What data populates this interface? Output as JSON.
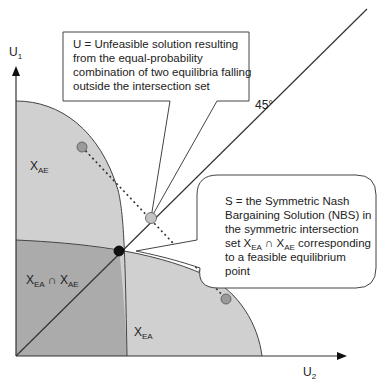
{
  "axes": {
    "y_label": "U",
    "y_label_sub": "1",
    "x_label": "U",
    "x_label_sub": "2",
    "diagonal_label": "45°"
  },
  "regions": {
    "ae": {
      "label": "X",
      "sub": "AE",
      "color": "#d0d0d0"
    },
    "ea": {
      "label": "X",
      "sub": "EA",
      "color": "#d0d0d0"
    },
    "intersection": {
      "label_a": "X",
      "sub_a": "EA",
      "op": "∩",
      "label_b": "X",
      "sub_b": "AE",
      "color": "#ababab"
    }
  },
  "points": {
    "S": {
      "x": 119,
      "y": 251,
      "color": "#111111"
    },
    "U": {
      "x": 151,
      "y": 218,
      "color": "#c4c4c4"
    },
    "AE_equilibrium": {
      "x": 82,
      "y": 147,
      "color": "#9a9a9a"
    },
    "EA_equilibrium": {
      "x": 226,
      "y": 299,
      "color": "#9a9a9a"
    }
  },
  "callouts": {
    "U": {
      "line1": "U = Unfeasible solution resulting",
      "line2": "from the equal-probability",
      "line3": "combination of two equilibria falling",
      "line4": "outside the intersection set"
    },
    "S": {
      "line1": "S = the Symmetric Nash",
      "line2": "Bargaining Solution (NBS) in",
      "line3": "the symmetric intersection",
      "line4_pre": "set X",
      "line4_sub1": "EA",
      "line4_op": " ∩ X",
      "line4_sub2": "AE",
      "line4_post": " corresponding",
      "line5": "to a feasible equilibrium",
      "line6": "point"
    }
  }
}
